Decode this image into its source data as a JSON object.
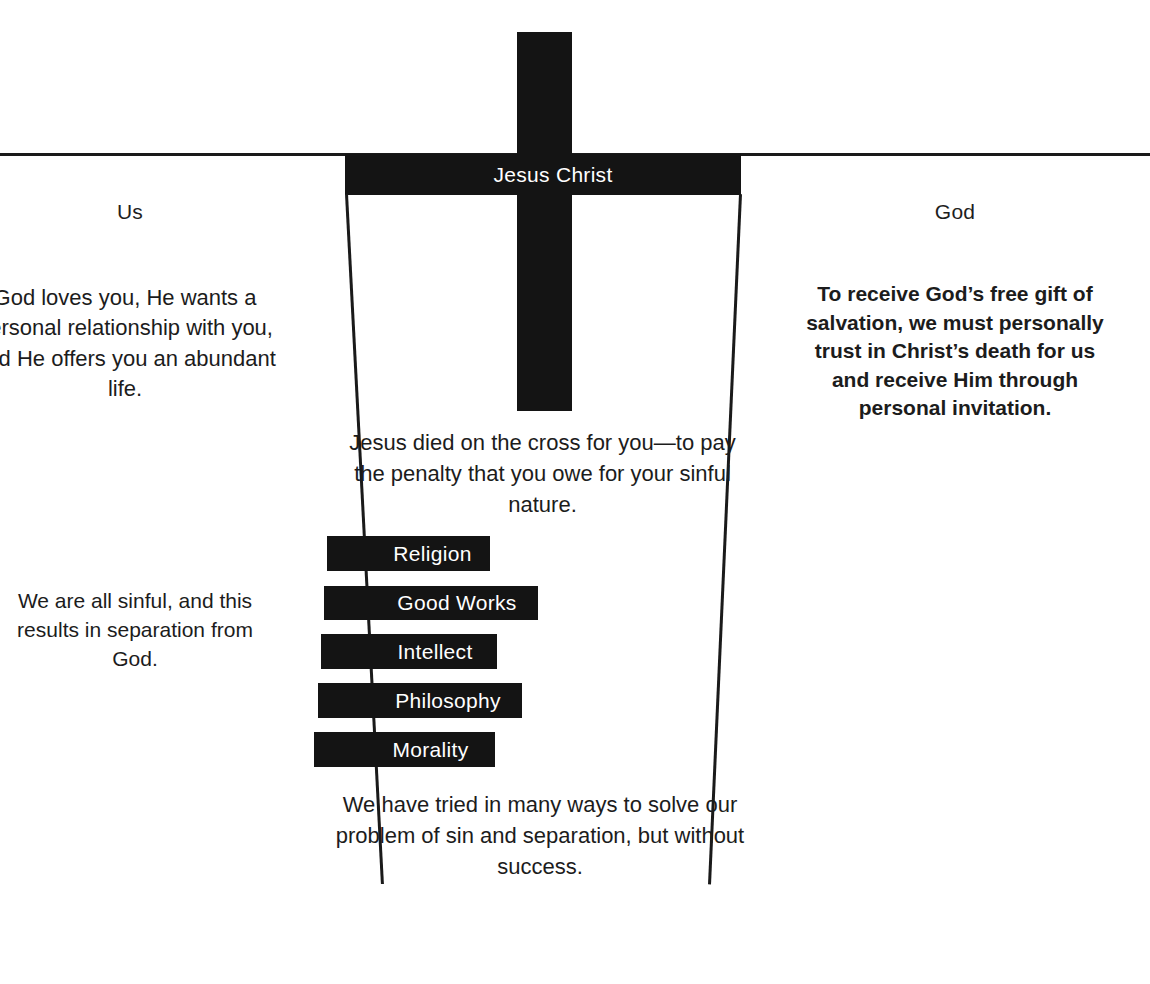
{
  "diagram": {
    "divider_line": "horizontal-separator",
    "cross": {
      "icon": "cross-icon",
      "label": "Jesus Christ"
    },
    "left_side": {
      "heading": "Us",
      "top_paragraph": "God loves you, He wants a personal relationship with you, and He offers you an abundant life.",
      "bottom_paragraph": "We are all sinful, and this results in separation from God."
    },
    "right_side": {
      "heading": "God",
      "paragraph": "To receive God’s free gift of salvation, we must personally trust in Christ’s death for us and receive Him through personal invitation."
    },
    "center": {
      "top_paragraph": "Jesus died on the cross for you—to pay the penalty that you owe for your sinful nature.",
      "bottom_paragraph": "We have tried in many ways to solve our problem of sin and separation, but without success."
    },
    "attempt_bars": [
      {
        "label": "Religion"
      },
      {
        "label": "Good Works"
      },
      {
        "label": "Intellect"
      },
      {
        "label": "Philosophy"
      },
      {
        "label": "Morality"
      }
    ],
    "colors": {
      "ink": "#141414",
      "background": "#ffffff",
      "reverse_text": "#ffffff"
    }
  }
}
